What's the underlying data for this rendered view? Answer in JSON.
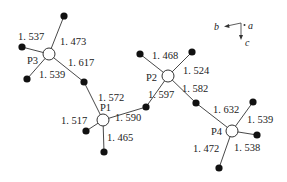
{
  "diagram": {
    "phosphorus_atoms": [
      {
        "id": "P3",
        "label": "P3",
        "x": 49,
        "y": 54
      },
      {
        "id": "P1",
        "label": "P1",
        "x": 103,
        "y": 120
      },
      {
        "id": "P2",
        "label": "P2",
        "x": 168,
        "y": 76
      },
      {
        "id": "P4",
        "label": "P4",
        "x": 232,
        "y": 131
      }
    ],
    "oxygen_atoms": [
      {
        "id": "O_P3_top",
        "x": 64,
        "y": 16
      },
      {
        "id": "O_P3_left",
        "x": 22,
        "y": 47
      },
      {
        "id": "O_P3_bottom",
        "x": 27,
        "y": 79
      },
      {
        "id": "O_bridge_P3_P1",
        "x": 84,
        "y": 82
      },
      {
        "id": "O_P1_left",
        "x": 86,
        "y": 131
      },
      {
        "id": "O_P1_bottom",
        "x": 104,
        "y": 152
      },
      {
        "id": "O_bridge_P1_P2",
        "x": 146,
        "y": 107
      },
      {
        "id": "O_P2_upperleft",
        "x": 140,
        "y": 54
      },
      {
        "id": "O_P2_upperright",
        "x": 192,
        "y": 52
      },
      {
        "id": "O_bridge_P2_P4",
        "x": 196,
        "y": 103
      },
      {
        "id": "O_P4_upperright",
        "x": 253,
        "y": 102
      },
      {
        "id": "O_P4_right",
        "x": 257,
        "y": 135
      },
      {
        "id": "O_P4_bottom",
        "x": 219,
        "y": 168
      }
    ],
    "bond_labels": {
      "p3_left": "1. 537",
      "p3_top": "1. 473",
      "p3_bridge": "1. 617",
      "p3_bottom": "1. 539",
      "p1_bridge_p3": "1. 572",
      "p1_left": "1. 517",
      "p1_bridge_p2": "1. 590",
      "p1_bottom": "1. 465",
      "p2_upperleft": "1. 468",
      "p2_upperright": "1. 524",
      "p2_bridge_p1": "1. 597",
      "p2_bridge_p4": "1. 582",
      "p4_bridge_p2": "1. 632",
      "p4_upperright": "1. 539",
      "p4_right": "1. 538",
      "p4_bottom": "1. 472"
    },
    "axes": {
      "a": "a",
      "b": "b",
      "c": "c"
    },
    "colors": {
      "line": "#333333",
      "oxygen": "#111111",
      "phosphorus_fill": "#ffffff"
    }
  }
}
